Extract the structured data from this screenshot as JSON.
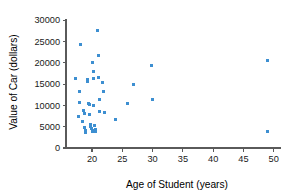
{
  "chart_data": {
    "type": "scatter",
    "title": "",
    "xlabel": "Age of Student (years)",
    "ylabel": "Value of Car (dollars)",
    "xlim": [
      15.7,
      51.2
    ],
    "ylim": [
      0,
      30500
    ],
    "xticks": [
      20,
      25,
      30,
      35,
      40,
      45,
      50
    ],
    "xtick_labels": [
      "20",
      "25",
      "30",
      "35",
      "40",
      "45",
      "50"
    ],
    "yticks": [
      0,
      5000,
      10000,
      15000,
      20000,
      25000,
      30000
    ],
    "ytick_labels": [
      "0",
      "5000",
      "10000",
      "15000",
      "20000",
      "25000",
      "30000"
    ],
    "grid": false,
    "legend": false,
    "marker_color": "#3d8fd1",
    "marker_shape": "square",
    "points": [
      {
        "x": 17.3,
        "y": 16400
      },
      {
        "x": 18.1,
        "y": 24300
      },
      {
        "x": 18.0,
        "y": 13300
      },
      {
        "x": 17.9,
        "y": 10600
      },
      {
        "x": 17.8,
        "y": 7300
      },
      {
        "x": 18.6,
        "y": 8900
      },
      {
        "x": 18.7,
        "y": 8200
      },
      {
        "x": 18.5,
        "y": 6300
      },
      {
        "x": 18.8,
        "y": 4800
      },
      {
        "x": 18.9,
        "y": 4200
      },
      {
        "x": 19.0,
        "y": 3700
      },
      {
        "x": 19.3,
        "y": 16000
      },
      {
        "x": 19.3,
        "y": 15700
      },
      {
        "x": 19.4,
        "y": 10400
      },
      {
        "x": 19.5,
        "y": 10100
      },
      {
        "x": 19.6,
        "y": 7800
      },
      {
        "x": 19.7,
        "y": 5500
      },
      {
        "x": 19.8,
        "y": 5100
      },
      {
        "x": 19.9,
        "y": 4600
      },
      {
        "x": 20.0,
        "y": 4100
      },
      {
        "x": 20.0,
        "y": 3800
      },
      {
        "x": 20.1,
        "y": 20100
      },
      {
        "x": 20.2,
        "y": 17900
      },
      {
        "x": 20.2,
        "y": 16200
      },
      {
        "x": 20.3,
        "y": 9900
      },
      {
        "x": 20.4,
        "y": 5200
      },
      {
        "x": 20.5,
        "y": 4400
      },
      {
        "x": 20.5,
        "y": 3900
      },
      {
        "x": 20.9,
        "y": 27500
      },
      {
        "x": 21.0,
        "y": 21600
      },
      {
        "x": 21.1,
        "y": 16500
      },
      {
        "x": 21.2,
        "y": 11300
      },
      {
        "x": 21.3,
        "y": 8500
      },
      {
        "x": 21.7,
        "y": 15300
      },
      {
        "x": 21.9,
        "y": 13200
      },
      {
        "x": 22.1,
        "y": 8400
      },
      {
        "x": 23.9,
        "y": 6700
      },
      {
        "x": 25.9,
        "y": 10400
      },
      {
        "x": 26.8,
        "y": 14800
      },
      {
        "x": 29.8,
        "y": 19300
      },
      {
        "x": 29.9,
        "y": 11400
      },
      {
        "x": 48.9,
        "y": 20500
      },
      {
        "x": 49.0,
        "y": 3900
      }
    ]
  }
}
